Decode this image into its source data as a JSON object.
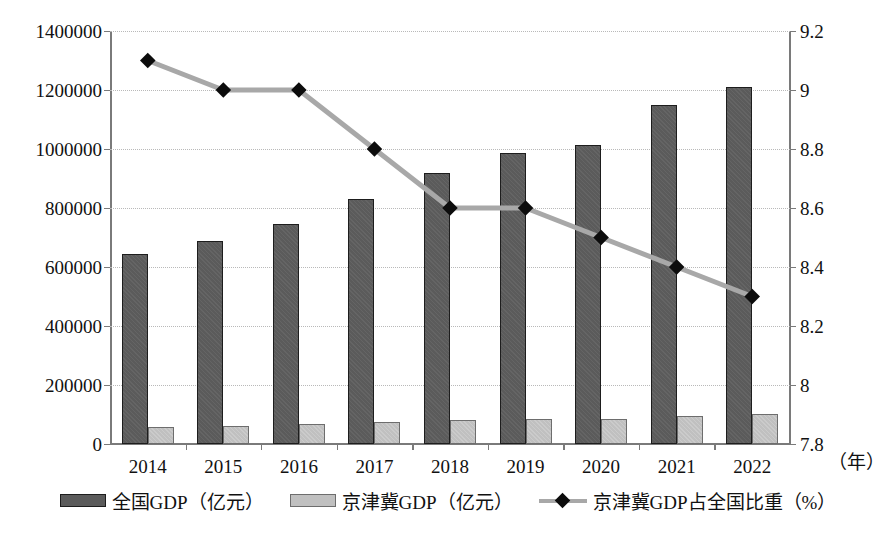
{
  "chart_data": {
    "type": "bar",
    "title": "",
    "xlabel": "年",
    "categories": [
      "2014",
      "2015",
      "2016",
      "2017",
      "2018",
      "2019",
      "2020",
      "2021",
      "2022"
    ],
    "grid": true,
    "legend_position": "bottom",
    "series": [
      {
        "name": "全国GDP（亿元）",
        "type": "bar",
        "axis": "left",
        "color": "#5b5b5b",
        "values": [
          643974,
          689052,
          746395,
          832036,
          919281,
          986515,
          1013567,
          1149237,
          1210207
        ]
      },
      {
        "name": "京津冀GDP（亿元）",
        "type": "bar",
        "axis": "left",
        "color": "#c0c0c0",
        "values": [
          58610,
          62172,
          67566,
          74637,
          80270,
          84580,
          86393,
          96356,
          100293
        ]
      },
      {
        "name": "京津冀GDP占全国比重（%）",
        "type": "line",
        "axis": "right",
        "color": "#a8a8a8",
        "marker": "diamond",
        "marker_color": "#0c0c0c",
        "values": [
          9.1,
          9.0,
          9.0,
          8.8,
          8.6,
          8.6,
          8.5,
          8.4,
          8.3
        ]
      }
    ],
    "left_axis": {
      "label": "",
      "min": 0,
      "max": 1400000,
      "step": 200000,
      "ticks": [
        "0",
        "200000",
        "400000",
        "600000",
        "800000",
        "1000000",
        "1200000",
        "1400000"
      ]
    },
    "right_axis": {
      "label": "",
      "min": 7.8,
      "max": 9.2,
      "step": 0.2,
      "ticks": [
        "7.8",
        "8",
        "8.2",
        "8.4",
        "8.6",
        "8.8",
        "9",
        "9.2"
      ]
    }
  },
  "legend": {
    "items": [
      {
        "label": "全国GDP（亿元）",
        "marker": "bar-dark"
      },
      {
        "label": "京津冀GDP（亿元）",
        "marker": "bar-light"
      },
      {
        "label": "京津冀GDP占全国比重（%）",
        "marker": "line-diamond"
      }
    ]
  },
  "xaxis_unit": "（年）",
  "colors": {
    "bar_national": "#5b5b5b",
    "bar_jjj": "#c0c0c0",
    "line": "#a8a8a8",
    "marker": "#0c0c0c",
    "grid": "#b9b9b9",
    "axis": "#7a7a7a",
    "text": "#111111"
  }
}
